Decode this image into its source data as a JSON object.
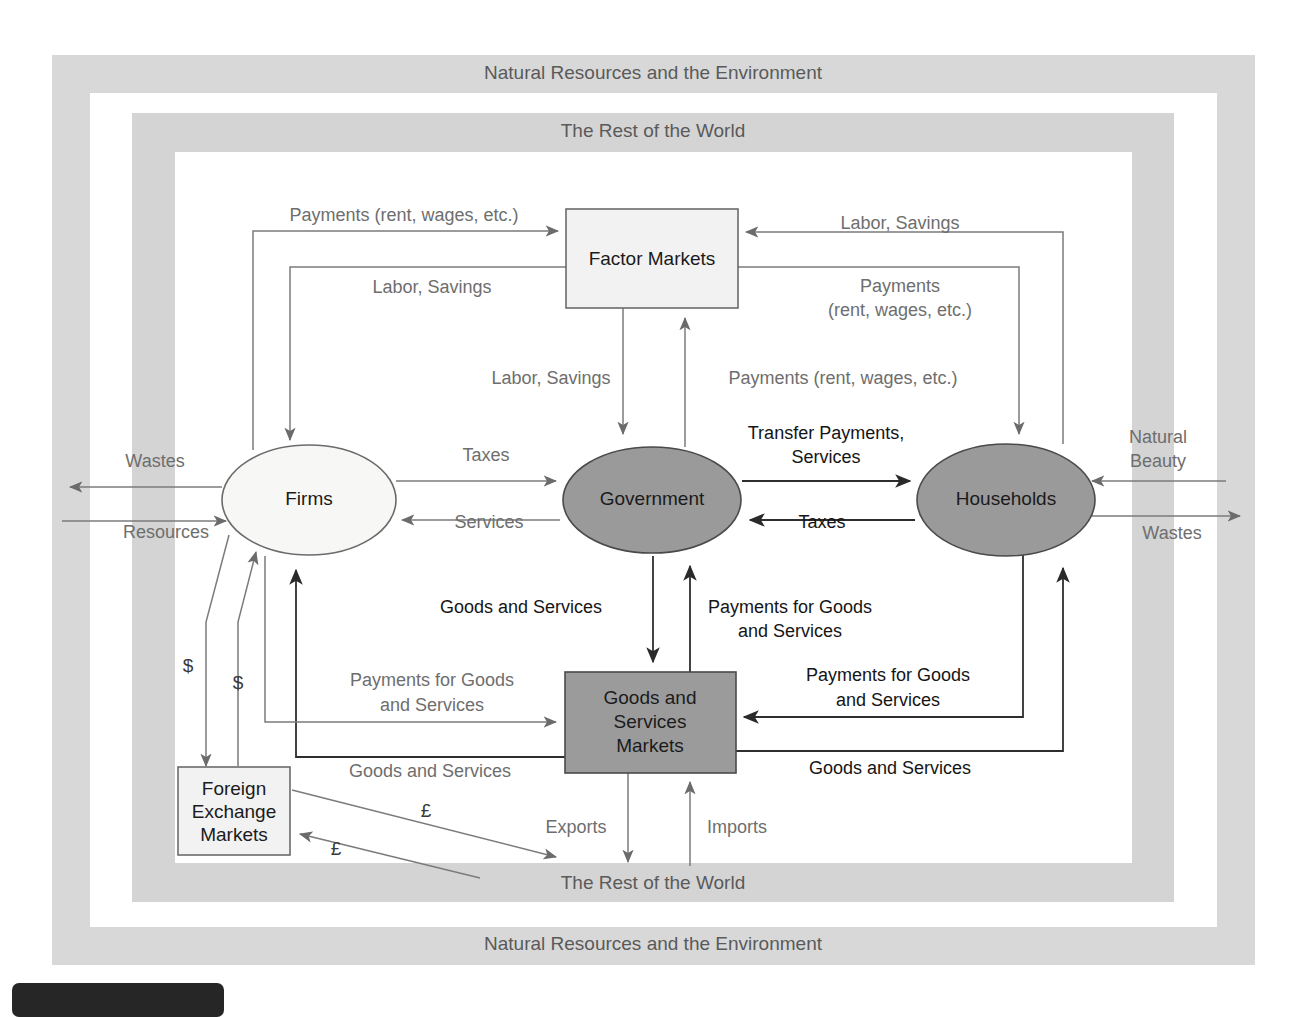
{
  "figure": {
    "type": "diagram",
    "kind": "circular-flow-of-economic-activity",
    "outer_band_label": "Natural Resources and the Environment",
    "outer_band_label_bottom": "Natural Resources and the Environment",
    "inner_band_label": "The Rest of the World",
    "inner_band_label_bottom": "The Rest of the World"
  },
  "colors": {
    "band": "#d8d8d8",
    "node_dark_fill": "#9a9a9a",
    "node_light_fill": "#f4f4f2",
    "line": "#7b7b7b",
    "line_dark": "#2e2e2e",
    "label_gray": "#6e6e6e",
    "label_black": "#151515",
    "page_background": "#ffffff",
    "tab": "#262626"
  },
  "nodes": {
    "factor_markets": {
      "label": "Factor Markets",
      "shape": "rect",
      "fill": "light"
    },
    "goods_services_markets": {
      "label_line1": "Goods and",
      "label_line2": "Services",
      "label_line3": "Markets",
      "shape": "rect",
      "fill": "dark"
    },
    "foreign_exchange_markets": {
      "label_line1": "Foreign",
      "label_line2": "Exchange",
      "label_line3": "Markets",
      "shape": "rect",
      "fill": "light"
    },
    "firms": {
      "label": "Firms",
      "shape": "ellipse",
      "fill": "light"
    },
    "government": {
      "label": "Government",
      "shape": "ellipse",
      "fill": "dark"
    },
    "households": {
      "label": "Households",
      "shape": "ellipse",
      "fill": "dark"
    }
  },
  "edge_labels": {
    "payments_rent_wages_top_left": "Payments (rent, wages, etc.)",
    "labor_savings_top_left": "Labor, Savings",
    "labor_savings_top_right": "Labor, Savings",
    "payments_line1_right": "Payments",
    "payments_line2_right": "(rent, wages, etc.)",
    "labor_savings_mid_left": "Labor, Savings",
    "payments_rent_wages_mid_right": "Payments (rent, wages, etc.)",
    "wastes_left": "Wastes",
    "resources_left": "Resources",
    "taxes_firms_to_government": "Taxes",
    "services_government_to_firms": "Services",
    "transfer_payments_line1": "Transfer Payments,",
    "transfer_payments_line2": "Services",
    "taxes_households_to_government": "Taxes",
    "natural_beauty_line1": "Natural",
    "natural_beauty_line2": "Beauty",
    "wastes_right": "Wastes",
    "goods_and_services_gov": "Goods and Services",
    "payments_for_goods_line1_center": "Payments for Goods",
    "payments_for_goods_line2_center": "and Services",
    "payments_for_goods_line1_left": "Payments for Goods",
    "payments_for_goods_line2_left": "and Services",
    "payments_for_goods_line1_right": "Payments for Goods",
    "payments_for_goods_line2_right": "and Services",
    "goods_and_services_firms": "Goods and Services",
    "goods_and_services_households": "Goods and Services",
    "dollar_left_outer": "$",
    "dollar_left_inner": "$",
    "pound_upper": "£",
    "pound_lower": "£",
    "exports": "Exports",
    "imports": "Imports"
  }
}
